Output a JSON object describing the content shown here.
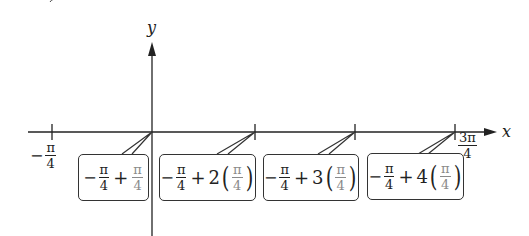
{
  "diagram": {
    "type": "number-line-with-callouts",
    "axes": {
      "x_label": "x",
      "y_label": "y"
    },
    "tick_labels": {
      "left": {
        "sign": "−",
        "num": "π",
        "den": "4"
      },
      "right": {
        "num": "3π",
        "den": "4"
      }
    },
    "callouts": [
      {
        "lead": "−",
        "num": "π",
        "den": "4",
        "op": "+",
        "coef": "",
        "term_num": "π",
        "term_den": "4"
      },
      {
        "lead": "−",
        "num": "π",
        "den": "4",
        "op": "+",
        "coef": "2",
        "term_num": "π",
        "term_den": "4"
      },
      {
        "lead": "−",
        "num": "π",
        "den": "4",
        "op": "+",
        "coef": "3",
        "term_num": "π",
        "term_den": "4"
      },
      {
        "lead": "−",
        "num": "π",
        "den": "4",
        "op": "+",
        "coef": "4",
        "term_num": "π",
        "term_den": "4"
      }
    ],
    "colors": {
      "ink": "#222222",
      "faded_term": "#8a8a8a",
      "background": "#ffffff"
    }
  }
}
